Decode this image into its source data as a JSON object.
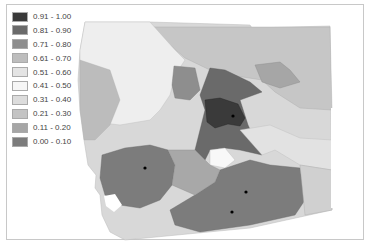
{
  "legend": {
    "items": [
      {
        "label": "0.91 - 1.00",
        "color": "#3a3a3a"
      },
      {
        "label": "0.81 - 0.90",
        "color": "#6a6a6a"
      },
      {
        "label": "0.71 - 0.80",
        "color": "#8e8e8e"
      },
      {
        "label": "0.61 - 0.70",
        "color": "#bdbdbd"
      },
      {
        "label": "0.51 - 0.60",
        "color": "#e4e4e4"
      },
      {
        "label": "0.41 - 0.50",
        "color": "#f6f6f6"
      },
      {
        "label": "0.31 - 0.40",
        "color": "#dcdcdc"
      },
      {
        "label": "0.21 - 0.30",
        "color": "#c4c4c4"
      },
      {
        "label": "0.11 - 0.20",
        "color": "#a6a6a6"
      },
      {
        "label": "0.00 - 0.10",
        "color": "#7c7c7c"
      }
    ]
  },
  "map": {
    "points": [
      {
        "x": 233,
        "y": 116
      },
      {
        "x": 145,
        "y": 168
      },
      {
        "x": 246,
        "y": 192
      },
      {
        "x": 232,
        "y": 212
      }
    ]
  }
}
